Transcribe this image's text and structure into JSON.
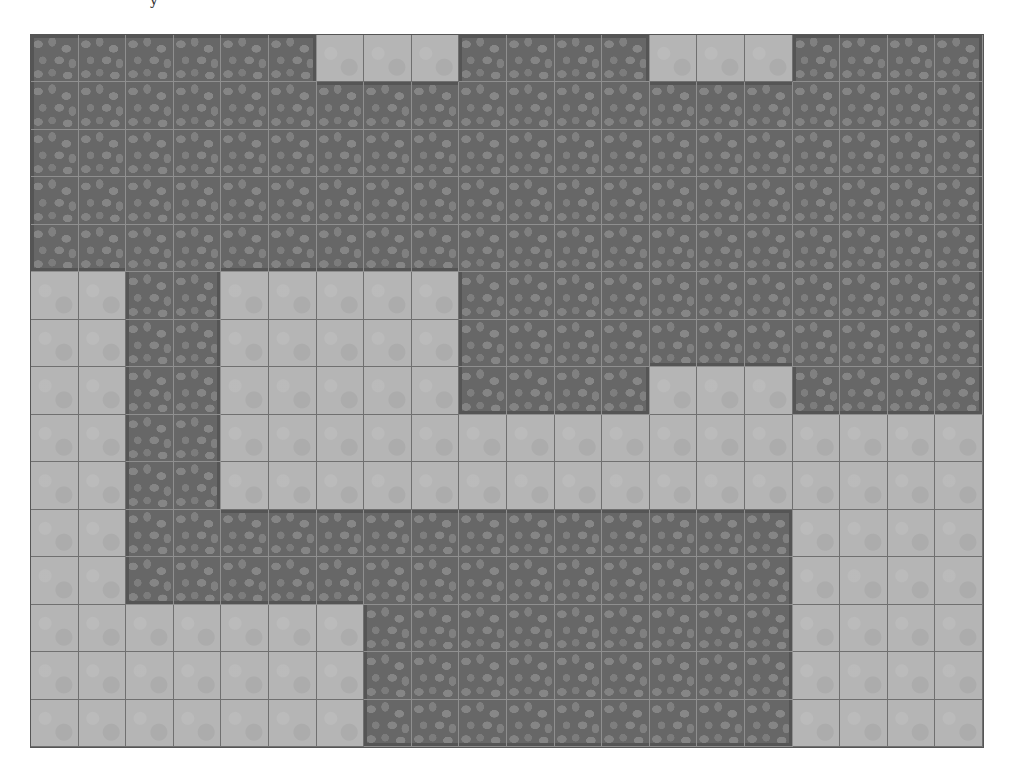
{
  "caption_fragment": "y",
  "map": {
    "columns": 20,
    "rows": 15,
    "legend": {
      "F": "floor",
      "S": "stone-wall"
    },
    "colors": {
      "floor": "#b5b5b5",
      "stone": "#676767",
      "cobble": "#858585",
      "floor_grid": "#707070",
      "stone_grid": "#8f8f8f",
      "background": "#ffffff"
    },
    "grid": [
      "SSSSSSFFFSSSSFFFSSSS",
      "SSSSSSSSSSSSSSSSSSSS",
      "SSSSSSSSSSSSSSSSSSSS",
      "SSSSSSSSSSSSSSSSSSSS",
      "SSSSSSSSSSSSSSSSSSSS",
      "FFSSFFFFFSSSSSSSSSSS",
      "FFSSFFFFFSSSSSSSSSSS",
      "FFSSFFFFFSSSSFFFSSSS",
      "FFSSFFFFFFFFFFFFFFFF",
      "FFSSFFFFFFFFFFFFFFFF",
      "FFSSSSSSSSSSSSSSFFFF",
      "FFSSSSSSSSSSSSSSFFFF",
      "FFFFFFFSSSSSSSSSFFFF",
      "FFFFFFFSSSSSSSSSFFFF",
      "FFFFFFFSSSSSSSSSFFFF"
    ]
  }
}
